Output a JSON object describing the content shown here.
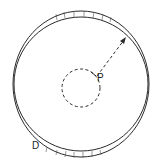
{
  "diagram": {
    "labels": {
      "point": "P",
      "disk": "D"
    },
    "colors": {
      "stroke": "#2a2a2a",
      "background": "#ffffff"
    }
  }
}
